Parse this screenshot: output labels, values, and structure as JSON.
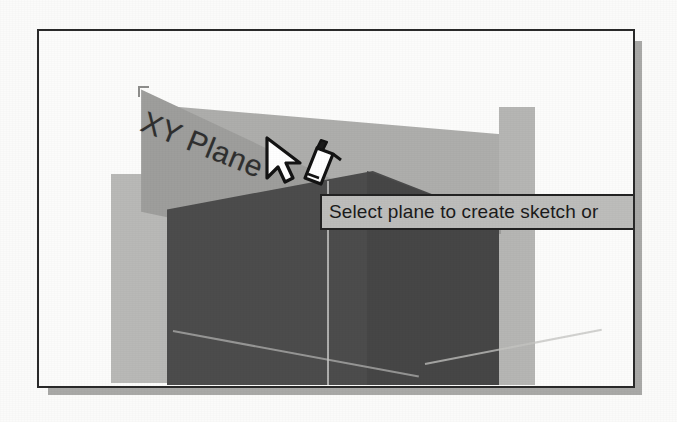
{
  "application": {
    "kind": "cad-modeling-viewport",
    "window_title": ""
  },
  "viewport": {
    "name": "3d-model-viewport",
    "background_color": "#fcfcfb",
    "frame_border_color": "#2a2a2a",
    "shadow_color": "#a9a9a7"
  },
  "geometry": {
    "plane_label": "XY Plane",
    "parts": [
      {
        "name": "plane-xy",
        "label": "XY Plane",
        "fill": "#9e9e9c"
      },
      {
        "name": "plane-left-light",
        "label": "",
        "fill": "#b9b9b7"
      },
      {
        "name": "plane-right-light",
        "label": "",
        "fill": "#aeaeac"
      },
      {
        "name": "plane-ground-right",
        "label": "",
        "fill": "#b6b6b4"
      },
      {
        "name": "solid-front",
        "label": "",
        "fill": "#4c4c4c"
      },
      {
        "name": "solid-right-face",
        "label": "",
        "fill": "#464646"
      }
    ]
  },
  "cursor": {
    "pointer_icon": "arrow-cursor-icon",
    "mode_icon": "sketch-pencil-icon",
    "x": 268,
    "y": 135
  },
  "tooltip": {
    "text": "Select plane to create sketch or",
    "truncated": true,
    "background_color": "#bdbdbb",
    "border_color": "#232323",
    "text_color": "#1b1b1b"
  }
}
